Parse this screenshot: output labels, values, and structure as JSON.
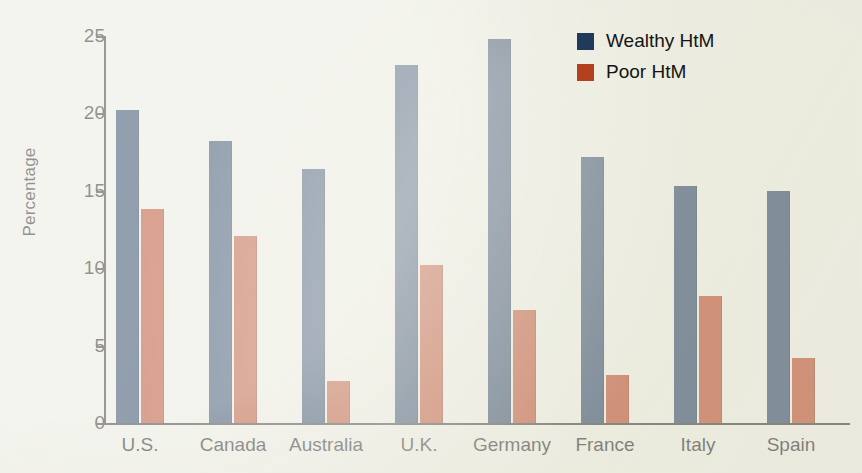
{
  "chart_data": {
    "type": "bar",
    "title": "",
    "subtitle": "",
    "xlabel": "",
    "ylabel": "Percentage",
    "ylim": [
      0,
      25
    ],
    "yticks": [
      0,
      5,
      10,
      15,
      20,
      25
    ],
    "ytick_labels": [
      "0",
      "5",
      "10",
      "15",
      "20",
      "25"
    ],
    "grid": false,
    "legend_position": "top-right",
    "categories": [
      "U.S.",
      "Canada",
      "Australia",
      "U.K.",
      "Germany",
      "France",
      "Italy",
      "Spain"
    ],
    "series": [
      {
        "name": "Wealthy HtM",
        "color": "#203a5c",
        "values": [
          20.2,
          18.2,
          16.4,
          23.1,
          24.8,
          17.2,
          15.3,
          15.0
        ]
      },
      {
        "name": "Poor HtM",
        "color": "#b3411e",
        "values": [
          13.8,
          12.1,
          2.7,
          10.2,
          7.3,
          3.1,
          8.2,
          4.2
        ]
      }
    ]
  },
  "axis": {
    "y_title": "Percentage"
  },
  "legend": {
    "items": [
      {
        "label": "Wealthy HtM",
        "color": "#203a5c"
      },
      {
        "label": "Poor HtM",
        "color": "#b3411e"
      }
    ]
  },
  "colors": {
    "background": "#e8e9dd",
    "axis": "#2b2b2b",
    "wealthy": "#203a5c",
    "poor": "#b3411e",
    "text": "#1c1c1c"
  }
}
